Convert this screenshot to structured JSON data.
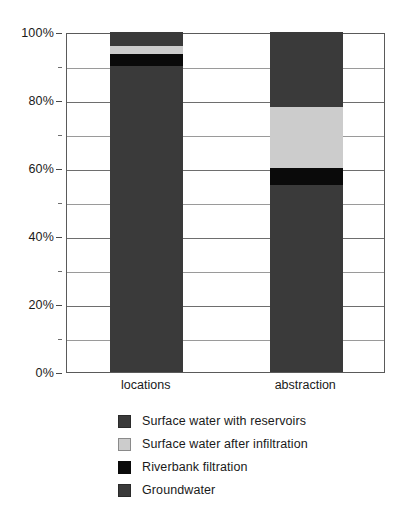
{
  "chart_data": {
    "type": "bar",
    "stacked": true,
    "normalized": "100%",
    "title": "",
    "subtitle": "",
    "xlabel": "",
    "ylabel": "",
    "categories": [
      "locations",
      "abstraction"
    ],
    "ylim": [
      0,
      100
    ],
    "ytick_values": [
      0,
      20,
      40,
      60,
      80,
      100
    ],
    "ytick_labels": [
      "0%",
      "20%",
      "40%",
      "60%",
      "80%",
      "100%"
    ],
    "yminor_tick_values": [
      10,
      30,
      50,
      70,
      90
    ],
    "grid": true,
    "grid_axis": "y",
    "legend_position": "bottom",
    "stack_order_bottom_to_top": [
      "Groundwater",
      "Riverbank filtration",
      "Surface water after infiltration",
      "Surface water with reservoirs"
    ],
    "series": [
      {
        "name": "Groundwater",
        "color": "#3a3a3a",
        "values": [
          90,
          55
        ]
      },
      {
        "name": "Riverbank filtration",
        "color": "#0a0a0a",
        "values": [
          3.5,
          5
        ]
      },
      {
        "name": "Surface water after infiltration",
        "color": "#cccccc",
        "values": [
          2.5,
          18
        ]
      },
      {
        "name": "Surface water with reservoirs",
        "color": "#3a3a3a",
        "values": [
          4,
          22
        ]
      }
    ],
    "annotations": []
  },
  "axes": {
    "y_ticks": [
      {
        "label": "100%",
        "value": 100
      },
      {
        "label": "80%",
        "value": 80
      },
      {
        "label": "60%",
        "value": 60
      },
      {
        "label": "40%",
        "value": 40
      },
      {
        "label": "20%",
        "value": 20
      },
      {
        "label": "0%",
        "value": 0
      }
    ],
    "x_ticks": [
      {
        "label": "locations"
      },
      {
        "label": "abstraction"
      }
    ]
  },
  "legend": {
    "items": [
      {
        "label": "Surface water with reservoirs",
        "swatch": "ink-dark"
      },
      {
        "label": "Surface water after infiltration",
        "swatch": "ink-light"
      },
      {
        "label": "Riverbank filtration",
        "swatch": "ink-black"
      },
      {
        "label": "Groundwater",
        "swatch": "ink-dark"
      }
    ]
  },
  "colors": {
    "dark_gray": "#3a3a3a",
    "black": "#0a0a0a",
    "light_gray": "#cccccc",
    "gridline": "#6e6e6e",
    "axis": "#5a5a5a",
    "background": "#ffffff",
    "text": "#1a1a1a"
  }
}
